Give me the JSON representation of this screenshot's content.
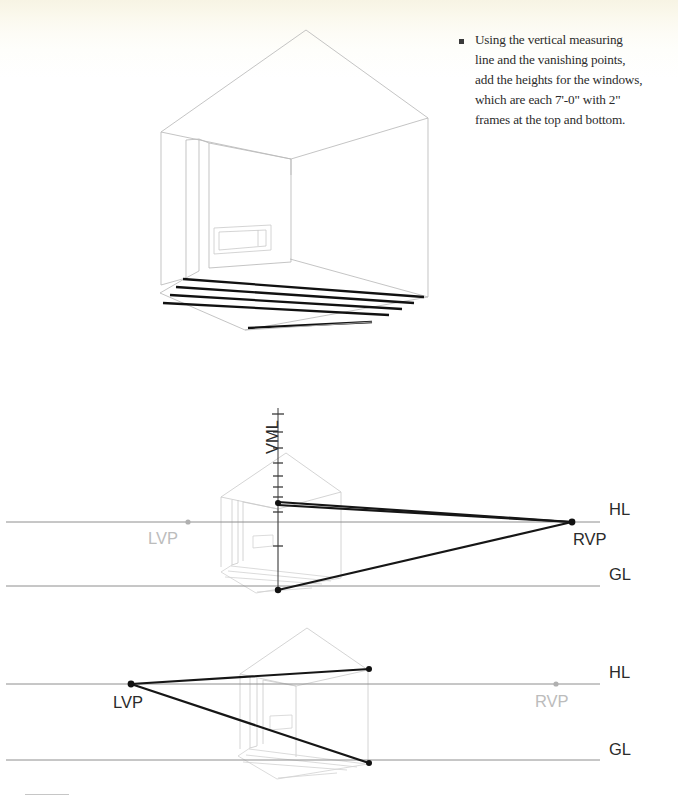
{
  "page": {
    "background_color": "#ffffff",
    "paper_tint_color": "#f7f4e4",
    "width": 678,
    "height": 806
  },
  "instruction": {
    "bullet_glyph": "square-bullet",
    "text": "Using the vertical measuring line and the vanishing points, add the heights for the windows, which are each 7'-0\" with 2\" frames at the top and bottom.",
    "lines": [
      "Using the vertical measuring",
      "line and the vanishing points,",
      "add the heights for the windows,",
      "which are each 7'-0\" with 2\"",
      "frames at the top and bottom."
    ],
    "window_height": "7'-0\"",
    "frame_thickness": "2\""
  },
  "figures": [
    {
      "id": "figure-top",
      "name": "interior-room-perspective",
      "caption": "",
      "elements": [
        "gable-roof",
        "left-wall",
        "right-wall",
        "back-wall",
        "doorway",
        "window-opening",
        "floor-planks"
      ],
      "floor_plank_count": 5
    },
    {
      "id": "figure-middle",
      "name": "rvp-construction-diagram",
      "labels": {
        "vml": "VML",
        "hl": "HL",
        "gl": "GL",
        "lvp": "LVP",
        "rvp": "RVP"
      },
      "active_vanishing_point": "RVP",
      "inactive_vanishing_point": "LVP",
      "vml_tick_count": 9,
      "construction_lines": 3,
      "colors": {
        "active": "#161616",
        "inactive": "#bcbcbc",
        "rule": "#8e8e8e",
        "ghost": "#c9c9c9"
      }
    },
    {
      "id": "figure-bottom",
      "name": "lvp-construction-diagram",
      "labels": {
        "hl": "HL",
        "gl": "GL",
        "lvp": "LVP",
        "rvp": "RVP"
      },
      "active_vanishing_point": "LVP",
      "inactive_vanishing_point": "RVP",
      "construction_lines": 2,
      "colors": {
        "active": "#161616",
        "inactive": "#bcbcbc",
        "rule": "#8e8e8e",
        "ghost": "#c9c9c9"
      }
    }
  ]
}
